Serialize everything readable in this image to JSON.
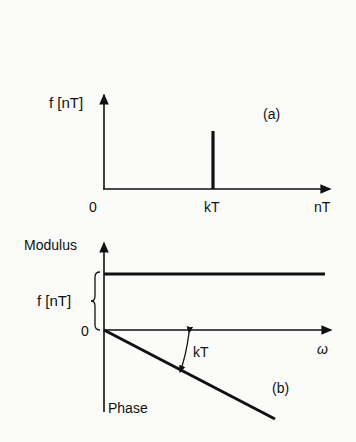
{
  "panel_a": {
    "y_label": "f [nT]",
    "x_label": "nT",
    "origin_label": "0",
    "tick_label": "kT",
    "panel_label": "(a)"
  },
  "panel_b": {
    "modulus_label": "Modulus",
    "magnitude_label": "f [nT]",
    "origin_label": "0",
    "x_label": "ω",
    "angle_label": "kT",
    "phase_label": "Phase",
    "panel_label": "(b)"
  }
}
